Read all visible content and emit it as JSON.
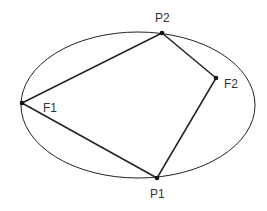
{
  "diagram": {
    "type": "geometry",
    "ellipse": {
      "cx": 138,
      "cy": 105,
      "rx": 117,
      "ry": 73
    },
    "points": [
      {
        "id": "P2",
        "label": "P2",
        "x": 162,
        "y": 33,
        "label_x": 155,
        "label_y": 22
      },
      {
        "id": "F2",
        "label": "F2",
        "x": 216,
        "y": 78,
        "label_x": 224,
        "label_y": 88
      },
      {
        "id": "F1",
        "label": "F1",
        "x": 22,
        "y": 103,
        "label_x": 43,
        "label_y": 112
      },
      {
        "id": "P1",
        "label": "P1",
        "x": 157,
        "y": 178,
        "label_x": 150,
        "label_y": 198
      }
    ],
    "segments": [
      [
        "F1",
        "P2"
      ],
      [
        "P2",
        "F2"
      ],
      [
        "F2",
        "P1"
      ],
      [
        "P1",
        "F1"
      ]
    ],
    "colors": {
      "stroke": "#222222",
      "label": "#333333",
      "background": "#ffffff"
    }
  }
}
